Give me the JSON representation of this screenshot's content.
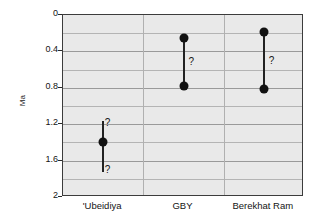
{
  "chart_data": {
    "type": "scatter",
    "title": "",
    "xlabel": "",
    "ylabel": "Ma",
    "ylim": [
      0,
      2
    ],
    "y_inverted": true,
    "grid": true,
    "legend": null,
    "y_ticks": [
      "0",
      "0.4",
      "0.8",
      "1.2",
      "1.6",
      "2"
    ],
    "y_tick_values": [
      0,
      0.4,
      0.8,
      1.2,
      1.6,
      2
    ],
    "y_minor_step": 0.2,
    "categories": [
      "'Ubeidiya",
      "GBY",
      "Berekhat Ram"
    ],
    "annotation_symbol": "?",
    "series": [
      {
        "name": "'Ubeidiya",
        "category": "'Ubeidiya",
        "points": [
          1.4
        ],
        "range_top": 1.17,
        "range_bottom": 1.73,
        "uncertainty_marks": [
          "?",
          "?"
        ],
        "uncertainty_positions": [
          "above",
          "below"
        ]
      },
      {
        "name": "GBY",
        "category": "GBY",
        "points": [
          0.25,
          0.78
        ],
        "range_top": 0.25,
        "range_bottom": 0.78,
        "uncertainty_marks": [
          "?"
        ],
        "uncertainty_positions": [
          "middle-right"
        ]
      },
      {
        "name": "Berekhat Ram",
        "category": "Berekhat Ram",
        "points": [
          0.19,
          0.81
        ],
        "range_top": 0.19,
        "range_bottom": 0.81,
        "uncertainty_marks": [
          "?"
        ],
        "uncertainty_positions": [
          "middle-right"
        ]
      }
    ]
  },
  "axis": {
    "y_title": "Ma",
    "ticks": [
      {
        "label": "0",
        "value": 0
      },
      {
        "label": "0.4",
        "value": 0.4
      },
      {
        "label": "0.8",
        "value": 0.8
      },
      {
        "label": "1.2",
        "value": 1.2
      },
      {
        "label": "1.6",
        "value": 1.6
      },
      {
        "label": "2",
        "value": 2
      }
    ]
  },
  "x_categories": [
    {
      "label": "'Ubeidiya"
    },
    {
      "label": "GBY"
    },
    {
      "label": "Berekhat Ram"
    }
  ],
  "colors": {
    "plot_background": "#e9e9e9",
    "plot_border": "#3c3c3c",
    "gridline": "#b4b4b4",
    "marker": "#111111",
    "text": "#141414"
  }
}
